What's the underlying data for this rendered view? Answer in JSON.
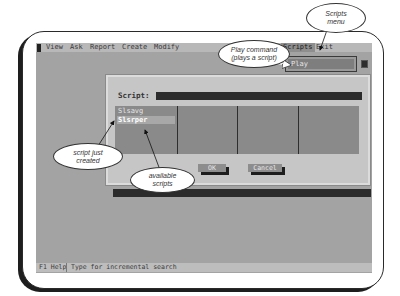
{
  "menubar": {
    "items": [
      {
        "label": "View"
      },
      {
        "label": "Ask"
      },
      {
        "label": "Report"
      },
      {
        "label": "Create"
      },
      {
        "label": "Modify"
      },
      {
        "label": "Tools"
      },
      {
        "label": "Scripts"
      },
      {
        "label": "Exit"
      }
    ]
  },
  "scripts_menu": {
    "items": [
      {
        "label": "Play"
      }
    ]
  },
  "dialog": {
    "script_label": "Script:",
    "script_value": "",
    "list": {
      "items": [
        {
          "label": "Slsavg",
          "selected": false
        },
        {
          "label": "Slsrper",
          "selected": true
        }
      ]
    },
    "ok_label": "OK",
    "cancel_label": "Cancel"
  },
  "statusbar": {
    "help": "F1 Help",
    "message": "Type for incremental search"
  },
  "callouts": {
    "scripts_menu": "Scripts menu",
    "play_command": "Play command (plays a script)",
    "script_just_created": "script just created",
    "available_scripts": "available scripts"
  },
  "colors": {
    "screen_bg": "#a3a3a3",
    "dialog_bg": "#c6c6c6",
    "list_bg": "#8a8a8a",
    "input_bg": "#2c2c2c"
  }
}
